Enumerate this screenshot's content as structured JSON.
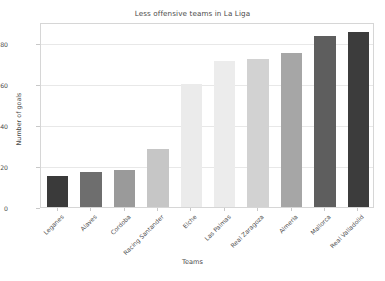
{
  "chart_data": {
    "type": "bar",
    "title": "Less offensive teams in La Liga",
    "xlabel": "Teams",
    "ylabel": "Number of goals",
    "categories": [
      "Leganes",
      "Alaves",
      "Cordoba",
      "Racing Santander",
      "Elche",
      "Las Palmas",
      "Real Zaragoza",
      "Almeria",
      "Mallorca",
      "Real Valladolid"
    ],
    "values": [
      15,
      17,
      18,
      28,
      60,
      71,
      72,
      75,
      83,
      85
    ],
    "bar_colors": [
      "#3a3a3a",
      "#6e6e6e",
      "#9a9a9a",
      "#c6c6c6",
      "#ebebeb",
      "#ececec",
      "#d2d2d2",
      "#a6a6a6",
      "#5e5e5e",
      "#3c3c3c"
    ],
    "ylim": [
      0,
      90
    ],
    "yticks": [
      0,
      20,
      40,
      60,
      80
    ],
    "ytick_labels": [
      "0",
      "20",
      "40",
      "60",
      "80"
    ],
    "grid": true,
    "grid_axis": "y",
    "grid_color": "#e8e8e8",
    "legend": null,
    "legend_position": "none",
    "background_color": "#ffffff",
    "axis_color": "#d6d6d6",
    "text_color": "#4a4a4a"
  }
}
